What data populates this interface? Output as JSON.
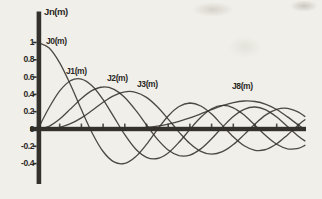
{
  "figure": {
    "kind": "scanned textbook line plot of Bessel functions",
    "background_color": "#f1efe9",
    "ink_color": "#34312c"
  },
  "chart_data": {
    "type": "line",
    "title": "Jn(m)",
    "xlabel": "",
    "ylabel": "",
    "xlim": [
      0,
      12.3
    ],
    "ylim": [
      -0.55,
      1.1
    ],
    "grid": false,
    "legend_position": "inline-curve-labels",
    "yticks": [
      1,
      0.8,
      0.6,
      0.4,
      0.2,
      0,
      -0.2,
      -0.4
    ],
    "ytick_labels": [
      "1",
      "0.8",
      "0.6",
      "0.4",
      "0.2",
      "0",
      "-0.2",
      "-0.4"
    ],
    "xticks": [
      1,
      2,
      3,
      4,
      5,
      6,
      7,
      8,
      9,
      10,
      11,
      12
    ],
    "x": [
      0,
      0.5,
      1,
      1.5,
      2,
      2.5,
      3,
      3.5,
      4,
      4.5,
      5,
      5.5,
      6,
      6.5,
      7,
      7.5,
      8,
      8.5,
      9,
      9.5,
      10,
      10.5,
      11,
      11.5,
      12,
      12.3
    ],
    "series": [
      {
        "name": "J0(m)",
        "values": [
          1,
          0.9385,
          0.7652,
          0.5118,
          0.2239,
          -0.0484,
          -0.2601,
          -0.3801,
          -0.3971,
          -0.3205,
          -0.1776,
          -0.0068,
          0.1506,
          0.2601,
          0.3001,
          0.2663,
          0.1717,
          0.0419,
          -0.0903,
          -0.1939,
          -0.2459,
          -0.2366,
          -0.1712,
          -0.0677,
          0.0477,
          0.107
        ]
      },
      {
        "name": "J1(m)",
        "values": [
          0,
          0.2423,
          0.4401,
          0.5579,
          0.5767,
          0.4971,
          0.3391,
          0.1374,
          -0.066,
          -0.2311,
          -0.3276,
          -0.3414,
          -0.2767,
          -0.1538,
          -0.0047,
          0.1352,
          0.2346,
          0.2731,
          0.2453,
          0.1613,
          0.0435,
          -0.0789,
          -0.1768,
          -0.2284,
          -0.2234,
          -0.189
        ]
      },
      {
        "name": "J2(m)",
        "values": [
          0,
          0.0306,
          0.1149,
          0.2321,
          0.3528,
          0.4461,
          0.4861,
          0.4586,
          0.3641,
          0.2178,
          0.0466,
          -0.1173,
          -0.2429,
          -0.3074,
          -0.3014,
          -0.2303,
          -0.113,
          0.0223,
          0.1448,
          0.2279,
          0.2546,
          0.2216,
          0.139,
          0.0279,
          -0.0849,
          -0.138
        ]
      },
      {
        "name": "J3(m)",
        "values": [
          0,
          0.0026,
          0.0196,
          0.061,
          0.1289,
          0.2166,
          0.3091,
          0.3867,
          0.4302,
          0.4247,
          0.3648,
          0.2561,
          0.1148,
          -0.0353,
          -0.1676,
          -0.258,
          -0.2911,
          -0.2626,
          -0.1809,
          -0.0653,
          0.0583,
          0.1633,
          0.2273,
          0.2381,
          0.1951,
          0.144
        ]
      },
      {
        "name": "J8(m)",
        "values": [
          0,
          0,
          0,
          0,
          0,
          0.0001,
          0.0005,
          0.0015,
          0.004,
          0.0091,
          0.0184,
          0.0334,
          0.0565,
          0.0883,
          0.128,
          0.1744,
          0.2235,
          0.2692,
          0.3051,
          0.3236,
          0.3179,
          0.2861,
          0.225,
          0.1396,
          0.0451,
          -0.011
        ]
      }
    ],
    "curve_labels": [
      {
        "text": "J0(m)",
        "left": 46,
        "top": 36
      },
      {
        "text": "J1(m)",
        "left": 66,
        "top": 66
      },
      {
        "text": "J2(m)",
        "left": 107,
        "top": 73
      },
      {
        "text": "J3(m)",
        "left": 137,
        "top": 79
      },
      {
        "text": "J8(m)",
        "left": 232,
        "top": 81
      }
    ]
  }
}
